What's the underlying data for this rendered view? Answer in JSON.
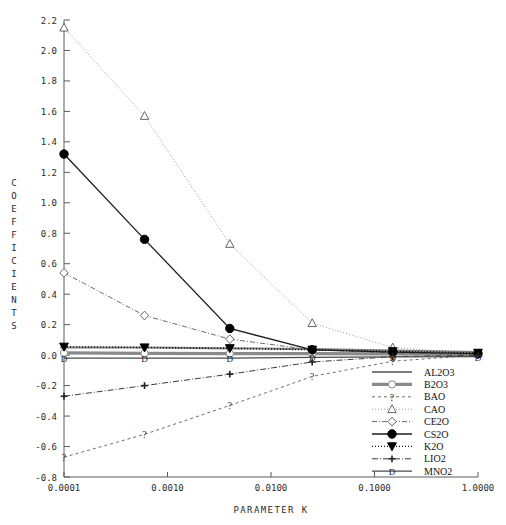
{
  "chart_data": {
    "type": "line",
    "title": "",
    "xlabel": "PARAMETER K",
    "ylabel": "COEFFICIENTS",
    "xscale": "log",
    "xlim": [
      0.0001,
      1.0
    ],
    "ylim": [
      -0.8,
      2.2
    ],
    "ytick_step": 0.2,
    "grid": false,
    "legend_position": "bottom-right",
    "xticks": [
      "0.0001",
      "0.0010",
      "0.0100",
      "0.1000",
      "1.0000"
    ],
    "xtick_values": [
      0.0001,
      0.001,
      0.01,
      0.1,
      1.0
    ],
    "yticks": [
      "2.2",
      "2.0",
      "1.8",
      "1.6",
      "1.4",
      "1.2",
      "1.0",
      "0.8",
      "0.6",
      "0.4",
      "0.2",
      "0.0",
      "-0.2",
      "-0.4",
      "-0.6",
      "-0.8"
    ],
    "ytick_values": [
      2.2,
      2.0,
      1.8,
      1.6,
      1.4,
      1.2,
      1.0,
      0.8,
      0.6,
      0.4,
      0.2,
      0.0,
      -0.2,
      -0.4,
      -0.6,
      -0.8
    ],
    "x": [
      0.0001,
      0.0006,
      0.004,
      0.025,
      0.15,
      1.0
    ],
    "series": [
      {
        "name": "AL2O3",
        "marker": "dash",
        "dash": "none",
        "color": "#7d7d7d",
        "width": 2.2,
        "values": [
          0.05,
          0.05,
          0.045,
          0.04,
          0.03,
          0.02
        ]
      },
      {
        "name": "B2O3",
        "marker": "circle-open",
        "dash": "none",
        "color": "#8a8a8a",
        "width": 3.2,
        "values": [
          0.015,
          0.012,
          0.01,
          0.01,
          0.008,
          0.005
        ]
      },
      {
        "name": "BAO",
        "marker": "question",
        "dash": "3,3",
        "color": "#6e6e6e",
        "width": 1.0,
        "values": [
          -0.67,
          -0.52,
          -0.33,
          -0.14,
          -0.04,
          0.0
        ]
      },
      {
        "name": "CAO",
        "marker": "triangle-open",
        "dash": "1,2",
        "color": "#9a9a9a",
        "width": 1.0,
        "values": [
          2.15,
          1.57,
          0.73,
          0.21,
          0.05,
          0.01
        ]
      },
      {
        "name": "CE2O",
        "marker": "diamond-open",
        "dash": "5,2,1,2",
        "color": "#6a6a6a",
        "width": 1.0,
        "values": [
          0.54,
          0.26,
          0.105,
          0.035,
          0.015,
          0.005
        ]
      },
      {
        "name": "CS2O",
        "marker": "circle-filled",
        "dash": "none",
        "color": "#1d1d1d",
        "width": 1.3,
        "values": [
          1.32,
          0.76,
          0.175,
          0.035,
          0.02,
          0.01
        ]
      },
      {
        "name": "K2O",
        "marker": "triangle-filled",
        "dash": "1,2",
        "color": "#141414",
        "width": 1.4,
        "values": [
          0.055,
          0.05,
          0.045,
          0.035,
          0.025,
          0.015
        ]
      },
      {
        "name": "LIO2",
        "marker": "plus",
        "dash": "6,2,1,2",
        "color": "#3a3a3a",
        "width": 1.0,
        "values": [
          -0.27,
          -0.2,
          -0.125,
          -0.045,
          -0.01,
          0.0
        ]
      },
      {
        "name": "MNO2",
        "marker": "letter-D",
        "dash": "none",
        "color": "#4a4a4a",
        "width": 1.3,
        "values": [
          -0.02,
          -0.02,
          -0.02,
          -0.015,
          -0.012,
          -0.01
        ]
      }
    ]
  },
  "legend": {
    "items": [
      "AL2O3",
      "B2O3",
      "BAO",
      "CAO",
      "CE2O",
      "CS2O",
      "K2O",
      "LIO2",
      "MNO2"
    ]
  }
}
